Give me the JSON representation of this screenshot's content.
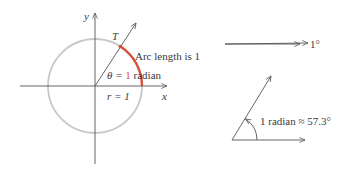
{
  "colors": {
    "axis": "#555555",
    "circle": "#c8c8c8",
    "arc": "#d9503a",
    "text": "#3a3a3a",
    "highlight": "#d9503a"
  },
  "unit_circle": {
    "y_axis_label": "y",
    "x_axis_label": "x",
    "point_label": "T",
    "arc_label": "Arc length is 1",
    "theta_prefix": "θ = ",
    "theta_value": "1",
    "theta_suffix": " radian",
    "radius_label": "r = 1"
  },
  "one_degree_figure": {
    "label": "1°"
  },
  "one_radian_figure": {
    "label": "1 radian ≈ 57.3°"
  }
}
